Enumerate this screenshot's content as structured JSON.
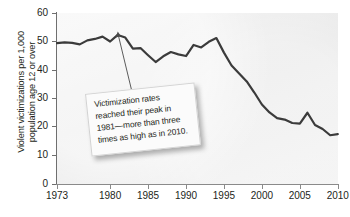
{
  "chart_data": {
    "type": "line",
    "title": "",
    "xlabel": "",
    "ylabel_lines": [
      "Violent victimizations per 1,000",
      "population age 12 or over"
    ],
    "ylabel": "Violent victimizations per 1,000 population age 12 or over",
    "xlim": [
      1973,
      2010
    ],
    "ylim": [
      0,
      60
    ],
    "yticks": [
      0,
      10,
      20,
      30,
      40,
      50,
      60
    ],
    "xticks": [
      1973,
      1980,
      1985,
      1990,
      1995,
      2000,
      2005,
      2010
    ],
    "grid": false,
    "legend": "none",
    "series_color": "#3b3b3b",
    "panel_color": "#ededed",
    "x": [
      1973,
      1974,
      1975,
      1976,
      1977,
      1978,
      1979,
      1980,
      1981,
      1982,
      1983,
      1984,
      1985,
      1986,
      1987,
      1988,
      1989,
      1990,
      1991,
      1992,
      1993,
      1994,
      1995,
      1996,
      1997,
      1998,
      1999,
      2000,
      2001,
      2002,
      2003,
      2004,
      2005,
      2006,
      2007,
      2008,
      2009,
      2010
    ],
    "values": [
      49.4,
      49.7,
      49.5,
      49.0,
      50.4,
      50.9,
      51.7,
      50.0,
      52.3,
      51.4,
      47.5,
      47.7,
      45.2,
      42.8,
      44.8,
      46.3,
      45.5,
      44.9,
      48.8,
      47.9,
      49.9,
      51.2,
      46.1,
      41.6,
      38.8,
      36.0,
      32.1,
      27.9,
      25.1,
      23.1,
      22.6,
      21.4,
      21.2,
      25.0,
      20.7,
      19.3,
      17.1,
      17.5
    ],
    "annotations": [
      {
        "name": "peak-callout",
        "text": "Victimization rates reached their peak in 1981—more than three times as high as in 2010.",
        "points_to_year": 1981,
        "points_to_value": 55
      }
    ]
  },
  "chart": {
    "y_axis_label_line1": "Violent victimizations per 1,000",
    "y_axis_label_line2": "population age 12 or over",
    "y_tick_labels": [
      "60",
      "50",
      "40",
      "30",
      "20",
      "10",
      "0"
    ],
    "x_tick_labels": [
      "1973",
      "1980",
      "1985",
      "1990",
      "1995",
      "2000",
      "2005",
      "2010"
    ],
    "callout_text": "Victimization rates reached their peak in 1981—more than three times as high as in 2010."
  }
}
